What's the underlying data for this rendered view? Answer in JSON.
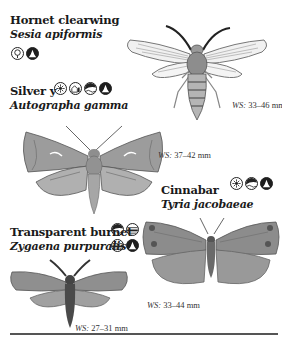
{
  "species": [
    {
      "common_name": "Hornet clearwing",
      "latin_name": "Sesia apiformis",
      "wingspan": "33–46 mm",
      "icons": [
        "tree-habitat-icon",
        "seasonal-flight-icon"
      ]
    },
    {
      "common_name": "Silver y",
      "latin_name": "Autographa gamma",
      "wingspan": "37–42 mm",
      "icons": [
        "flower-habitat-icon",
        "garden-habitat-icon",
        "coastal-habitat-icon",
        "seasonal-flight-icon"
      ]
    },
    {
      "common_name": "Cinnabar",
      "latin_name": "Tyria jacobaeae",
      "wingspan": "33–44 mm",
      "icons": [
        "flower-habitat-icon",
        "coastal-habitat-icon",
        "seasonal-flight-icon"
      ]
    },
    {
      "common_name": "Transparent burnet",
      "latin_name": "Zygaena purpuralis",
      "wingspan": "27–31 mm",
      "icons": [
        "coastal-habitat-icon",
        "wetland-habitat-icon",
        "wetland-habitat-icon",
        "seasonal-flight-icon"
      ]
    }
  ],
  "ws_label": "WS:",
  "colors": {
    "text": "#1a1a1a",
    "wing_gray": "#8a8a8a",
    "rule": "#555555"
  }
}
